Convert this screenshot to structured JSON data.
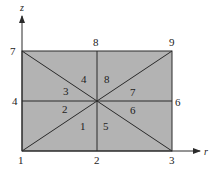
{
  "diagram": {
    "title": "",
    "type": "finite-element-mesh",
    "colors": {
      "fill": "#b3b3b3",
      "line": "#2a2a2a",
      "background": "#ffffff"
    },
    "axes": {
      "horizontal": {
        "label": "r"
      },
      "vertical": {
        "label": "z"
      }
    },
    "nodes": [
      {
        "id": "1",
        "label": "1",
        "position": "bottom-left"
      },
      {
        "id": "2",
        "label": "2",
        "position": "bottom-middle"
      },
      {
        "id": "3",
        "label": "3",
        "position": "bottom-right"
      },
      {
        "id": "4",
        "label": "4",
        "position": "middle-left"
      },
      {
        "id": "5",
        "label": "5",
        "position": "center"
      },
      {
        "id": "6",
        "label": "6",
        "position": "middle-right"
      },
      {
        "id": "7",
        "label": "7",
        "position": "top-left"
      },
      {
        "id": "8",
        "label": "8",
        "position": "top-middle"
      },
      {
        "id": "9",
        "label": "9",
        "position": "top-right"
      }
    ],
    "elements": [
      {
        "id": "1",
        "label": "1"
      },
      {
        "id": "2",
        "label": "2"
      },
      {
        "id": "3",
        "label": "3"
      },
      {
        "id": "4",
        "label": "4"
      },
      {
        "id": "5",
        "label": "5"
      },
      {
        "id": "6",
        "label": "6"
      },
      {
        "id": "7",
        "label": "7"
      },
      {
        "id": "8",
        "label": "8"
      }
    ]
  }
}
